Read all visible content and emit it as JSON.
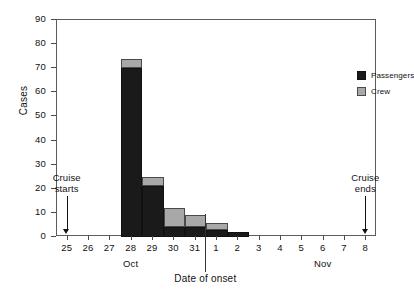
{
  "chart_data": {
    "type": "bar",
    "subtype": "stacked-histogram",
    "title": "",
    "xlabel": "Date of onset",
    "ylabel": "Cases",
    "ylim": [
      0,
      90
    ],
    "ytick_step": 10,
    "yticks": [
      "0",
      "10",
      "20",
      "30",
      "40",
      "50",
      "60",
      "70",
      "80",
      "90"
    ],
    "categories": [
      "25",
      "26",
      "27",
      "28",
      "29",
      "30",
      "31",
      "1",
      "2",
      "3",
      "4",
      "5",
      "6",
      "7",
      "8"
    ],
    "month_labels": [
      "Oct",
      "Nov"
    ],
    "grid": false,
    "legend_position": "top-right",
    "series": [
      {
        "name": "Passengers",
        "color": "#1a1a1a",
        "values": [
          0,
          0,
          0,
          70,
          21,
          4,
          4,
          3,
          2,
          0,
          0,
          0,
          0,
          0,
          0
        ]
      },
      {
        "name": "Crew",
        "color": "#a8a8a8",
        "values": [
          0,
          0,
          0,
          4,
          4,
          8,
          5,
          3,
          0,
          0,
          0,
          0,
          0,
          0,
          0
        ]
      }
    ],
    "totals": [
      0,
      0,
      0,
      74,
      25,
      12,
      9,
      6,
      2,
      0,
      0,
      0,
      0,
      0,
      0
    ],
    "annotations": [
      {
        "label_line1": "Cruise",
        "label_line2": "starts",
        "at_category": "25"
      },
      {
        "label_line1": "Cruise",
        "label_line2": "ends",
        "at_category": "8"
      }
    ]
  },
  "axes": {
    "y_title": "Cases",
    "x_title": "Date of onset"
  },
  "legend": {
    "items": [
      {
        "label": "Passengers"
      },
      {
        "label": "Crew"
      }
    ]
  },
  "annotations": {
    "cruise_starts": {
      "line1": "Cruise",
      "line2": "starts"
    },
    "cruise_ends": {
      "line1": "Cruise",
      "line2": "ends"
    }
  },
  "months": {
    "oct": "Oct",
    "nov": "Nov"
  }
}
